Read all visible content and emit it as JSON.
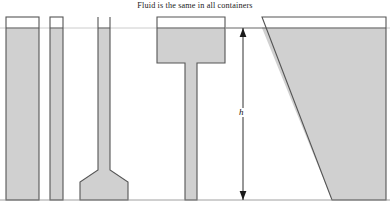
{
  "figure": {
    "caption": "Fluid is the same in all containers",
    "width": 390,
    "height": 213,
    "background_color": "#ffffff"
  },
  "style": {
    "fluid_fill_color": "#d0d0d0",
    "vessel_outline_color": "#555555",
    "guide_line_color": "#bfbfbf",
    "dimension_line_color": "#1a1a1a",
    "baseline_color": "#888888",
    "text_color": "#1a1a1a"
  },
  "geometry": {
    "fluid_level_y": 28,
    "base_y": 200,
    "vessel_top_y": 17,
    "guide_line_y": 28
  },
  "dimension": {
    "label": "h",
    "x": 243,
    "top_y": 28,
    "bottom_y": 200,
    "arrow_top": "up-arrowhead",
    "arrow_bottom": "down-arrowhead"
  },
  "containers": [
    {
      "id": "wide-rectangle",
      "name": "Wide rectangular vessel",
      "shape": "rectangle",
      "left": 6,
      "right": 39,
      "top": 17,
      "bottom": 200,
      "fluid_top": 28
    },
    {
      "id": "narrow-rectangle",
      "name": "Narrow rectangular vessel",
      "shape": "rectangle",
      "left": 50,
      "right": 63,
      "top": 17,
      "bottom": 200,
      "fluid_top": 28
    },
    {
      "id": "funnel",
      "name": "Funnel vessel with narrow neck and flared base",
      "shape": "funnel",
      "neck_left": 98,
      "neck_right": 110,
      "top": 17,
      "bottom": 200,
      "fluid_top": 28,
      "flare_start_y": 170,
      "base_left": 80,
      "base_right": 128,
      "shoulder_y": 182
    },
    {
      "id": "t-shape",
      "name": "T-shaped vessel with wide head and narrow stem",
      "shape": "tee",
      "head_left": 157,
      "head_right": 225,
      "head_top": 17,
      "head_bottom": 63,
      "fluid_top": 28,
      "stem_left": 185,
      "stem_right": 197,
      "bottom": 200
    },
    {
      "id": "wedge",
      "name": "Triangular wedge vessel",
      "shape": "wedge",
      "top_left": 262,
      "top_right": 386,
      "top": 17,
      "fluid_top": 28,
      "bottom": 200,
      "bottom_left": 332,
      "bottom_right": 386
    }
  ],
  "baseline": {
    "left": 0,
    "right": 390,
    "y": 200
  }
}
